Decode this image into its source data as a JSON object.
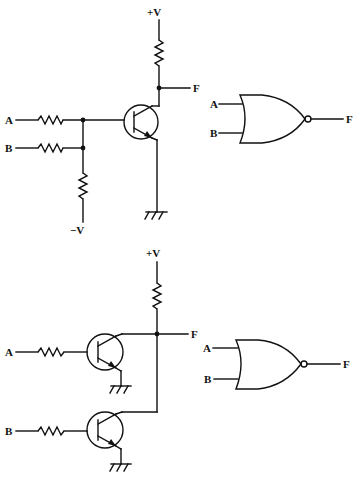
{
  "top_circuit": {
    "title": "Transistor NOR gate (single transistor, resistor inputs)",
    "supply_label": "+V",
    "neg_supply_label": "−V",
    "output_label": "F",
    "input_a_label": "A",
    "input_b_label": "B"
  },
  "top_gate": {
    "symbol": "NOR gate",
    "input_a_label": "A",
    "input_b_label": "B",
    "output_label": "F"
  },
  "bottom_circuit": {
    "title": "Transistor NOR gate (two parallel transistors)",
    "supply_label": "+V",
    "output_label": "F",
    "input_a_label": "A",
    "input_b_label": "B"
  },
  "bottom_gate": {
    "symbol": "NOR gate",
    "input_a_label": "A",
    "input_b_label": "B",
    "output_label": "F"
  }
}
